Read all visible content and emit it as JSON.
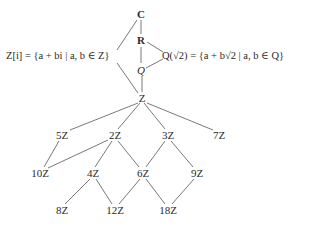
{
  "diagram": {
    "type": "lattice of rings / subrings",
    "nodes": [
      {
        "id": "C",
        "label": "C",
        "x": 141,
        "y": 14,
        "bold": true
      },
      {
        "id": "R",
        "label": "R",
        "x": 141,
        "y": 40,
        "bold": true
      },
      {
        "id": "Q",
        "label": "Q",
        "x": 141,
        "y": 70,
        "italic": true
      },
      {
        "id": "Z",
        "label": "Z",
        "x": 142,
        "y": 98
      },
      {
        "id": "5Z",
        "label": "5Z",
        "x": 62,
        "y": 135
      },
      {
        "id": "2Z",
        "label": "2Z",
        "x": 115,
        "y": 135
      },
      {
        "id": "3Z",
        "label": "3Z",
        "x": 168,
        "y": 135
      },
      {
        "id": "7Z",
        "label": "7Z",
        "x": 219,
        "y": 135
      },
      {
        "id": "10Z",
        "label": "10Z",
        "x": 40,
        "y": 173
      },
      {
        "id": "4Z",
        "label": "4Z",
        "x": 93,
        "y": 173
      },
      {
        "id": "6Z",
        "label": "6Z",
        "x": 143,
        "y": 173
      },
      {
        "id": "9Z",
        "label": "9Z",
        "x": 197,
        "y": 173
      },
      {
        "id": "8Z",
        "label": "8Z",
        "x": 62,
        "y": 210
      },
      {
        "id": "12Z",
        "label": "12Z",
        "x": 115,
        "y": 210
      },
      {
        "id": "18Z",
        "label": "18Z",
        "x": 168,
        "y": 210
      }
    ],
    "side_labels": {
      "gaussian": "Z[i] = {a + bi | a, b ∈ Z}",
      "sqrt2": "Q(√2) = {a + b√2 | a, b ∈ Q}"
    },
    "edges": [
      [
        "C",
        "R"
      ],
      [
        "C",
        "Zi"
      ],
      [
        "R",
        "Q"
      ],
      [
        "R",
        "Qs2"
      ],
      [
        "Q",
        "Qs2"
      ],
      [
        "Q",
        "Z"
      ],
      [
        "Zi",
        "Z"
      ],
      [
        "Z",
        "5Z"
      ],
      [
        "Z",
        "2Z"
      ],
      [
        "Z",
        "3Z"
      ],
      [
        "Z",
        "7Z"
      ],
      [
        "5Z",
        "10Z"
      ],
      [
        "2Z",
        "10Z"
      ],
      [
        "2Z",
        "4Z"
      ],
      [
        "2Z",
        "6Z"
      ],
      [
        "3Z",
        "6Z"
      ],
      [
        "3Z",
        "9Z"
      ],
      [
        "4Z",
        "8Z"
      ],
      [
        "4Z",
        "12Z"
      ],
      [
        "6Z",
        "12Z"
      ],
      [
        "6Z",
        "18Z"
      ],
      [
        "9Z",
        "18Z"
      ]
    ],
    "line_color": "#555555"
  }
}
